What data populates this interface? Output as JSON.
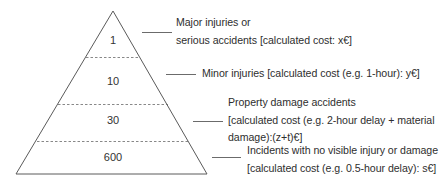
{
  "diagram": {
    "type": "accident-pyramid",
    "colors": {
      "outline": "#5a5a5a",
      "dashed": "#6a6a6a",
      "text": "#2e2e2e"
    },
    "tiers": [
      {
        "count": "1",
        "label_lines": [
          "Major injuries or",
          "serious accidents [calculated cost: x€]"
        ]
      },
      {
        "count": "10",
        "label_lines": [
          "Minor injuries [calculated cost (e.g. 1-hour): y€]"
        ]
      },
      {
        "count": "30",
        "label_lines": [
          "Property damage accidents",
          "[calculated cost (e.g. 2-hour delay + material",
          "damage):(z+t)€]"
        ]
      },
      {
        "count": "600",
        "label_lines": [
          "Incidents with no visible injury or damage",
          "[calculated cost (e.g. 0.5-hour delay): s€]"
        ]
      }
    ]
  }
}
